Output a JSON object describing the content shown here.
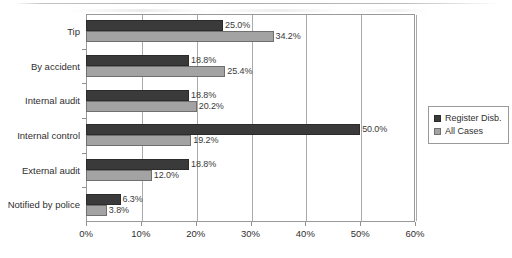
{
  "chart_data": {
    "type": "bar",
    "orientation": "horizontal",
    "title": "",
    "subtitle": "",
    "xlabel": "",
    "ylabel": "",
    "xlim": [
      0,
      60
    ],
    "xtick_labels": [
      "0%",
      "10%",
      "20%",
      "30%",
      "40%",
      "50%",
      "60%"
    ],
    "xticks": [
      0,
      10,
      20,
      30,
      40,
      50,
      60
    ],
    "grid": "vertical",
    "legend_position": "right",
    "categories": [
      "Tip",
      "By accident",
      "Internal audit",
      "Internal control",
      "External audit",
      "Notified by police"
    ],
    "series": [
      {
        "name": "Register Disb.",
        "color": "#3a3a3a",
        "values": [
          25.0,
          18.8,
          18.8,
          50.0,
          18.8,
          6.3
        ],
        "value_labels": [
          "25.0%",
          "18.8%",
          "18.8%",
          "50.0%",
          "18.8%",
          "6.3%"
        ]
      },
      {
        "name": "All Cases",
        "color": "#a3a3a3",
        "values": [
          34.2,
          25.4,
          20.2,
          19.2,
          12.0,
          3.8
        ],
        "value_labels": [
          "34.2%",
          "25.4%",
          "20.2%",
          "19.2%",
          "12.0%",
          "3.8%"
        ]
      }
    ]
  },
  "legend": {
    "items": [
      {
        "label": "Register Disb."
      },
      {
        "label": "All Cases"
      }
    ]
  },
  "colors": {
    "series_register_disb": "#3a3a3a",
    "series_all_cases": "#a3a3a3",
    "gridline": "#aaaaaa",
    "axis": "#9a9a9a",
    "text": "#2f2f2f",
    "background": "#ffffff"
  }
}
